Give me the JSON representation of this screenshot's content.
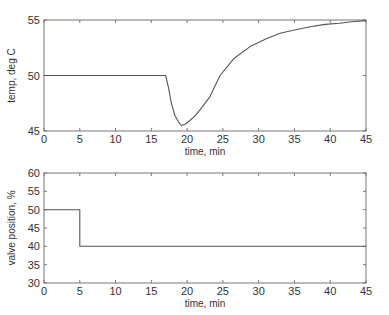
{
  "chart_data": [
    {
      "type": "line",
      "title": "",
      "xlabel": "time, min",
      "ylabel": "temp, deg C",
      "xlim": [
        0,
        45
      ],
      "ylim": [
        45,
        55
      ],
      "xticks": [
        0,
        5,
        10,
        15,
        20,
        25,
        30,
        35,
        40,
        45
      ],
      "yticks": [
        45,
        50,
        55
      ],
      "grid": false,
      "legend": null,
      "series": [
        {
          "name": "temperature",
          "x": [
            0,
            5,
            10,
            15,
            17.0,
            17.4,
            17.8,
            18.3,
            18.8,
            19.2,
            19.7,
            20.3,
            21.0,
            21.8,
            23.2,
            24.6,
            26.5,
            28.8,
            31.0,
            33.0,
            35.0,
            37.2,
            39.3,
            41.3,
            43.0,
            45
          ],
          "values": [
            50,
            50,
            50,
            50,
            50,
            48.9,
            47.5,
            46.4,
            45.8,
            45.5,
            45.6,
            45.9,
            46.3,
            46.9,
            48.1,
            50.0,
            51.5,
            52.6,
            53.3,
            53.8,
            54.1,
            54.4,
            54.6,
            54.7,
            54.85,
            54.95
          ]
        }
      ]
    },
    {
      "type": "line",
      "title": "",
      "xlabel": "time, min",
      "ylabel": "valve position, %",
      "xlim": [
        0,
        45
      ],
      "ylim": [
        30,
        60
      ],
      "xticks": [
        0,
        5,
        10,
        15,
        20,
        25,
        30,
        35,
        40,
        45
      ],
      "yticks": [
        30,
        35,
        40,
        45,
        50,
        55,
        60
      ],
      "grid": false,
      "legend": null,
      "series": [
        {
          "name": "valve position",
          "x": [
            0,
            5,
            5,
            45
          ],
          "values": [
            50,
            50,
            40,
            40
          ]
        }
      ]
    }
  ],
  "colors": {
    "line": "#555555",
    "axis": "#777777",
    "text": "#333333"
  }
}
